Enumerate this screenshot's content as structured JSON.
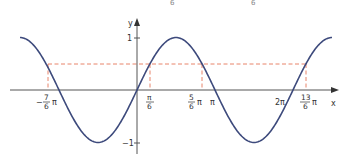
{
  "top_fragments": [
    "6",
    "6"
  ],
  "chart_data": {
    "type": "line",
    "title": "",
    "function": "y = sin(x)",
    "xlabel": "x",
    "ylabel": "y",
    "x_range_radians": [
      -4.712,
      7.854
    ],
    "ylim": [
      -1,
      1
    ],
    "grid": false,
    "legend": null,
    "series": [
      {
        "name": "sin(x)",
        "color": "#3d4a7c",
        "x": [
          -4.712,
          -3.665,
          -3.142,
          -2.618,
          -1.571,
          -0.524,
          0,
          0.524,
          1.571,
          2.618,
          3.142,
          3.665,
          4.712,
          5.76,
          6.283,
          6.807,
          7.854
        ],
        "values": [
          1,
          0.5,
          0,
          -0.5,
          -1,
          -0.5,
          0,
          0.5,
          1,
          0.5,
          0,
          -0.5,
          -1,
          -0.5,
          0,
          0.5,
          1
        ]
      }
    ],
    "reference_line": {
      "y": 0.5,
      "style": "dashed",
      "color": "#e8846b"
    },
    "marked_points": [
      {
        "label_num": "7",
        "label_den": "6",
        "sign": "−",
        "suffix": "π",
        "x": -3.665
      },
      {
        "label_num": "π",
        "label_den": "6",
        "sign": "",
        "suffix": "",
        "x": 0.524
      },
      {
        "label_num": "5",
        "label_den": "6",
        "sign": "",
        "suffix": "π",
        "x": 2.618
      },
      {
        "label_num": "13",
        "label_den": "6",
        "sign": "",
        "suffix": "π",
        "x": 6.807
      }
    ],
    "x_tick_labels": [
      "−7/6 π",
      "π/6",
      "5/6 π",
      "π",
      "2π",
      "13/6 π"
    ],
    "y_tick_labels": [
      "1",
      "−1"
    ],
    "axis_labels": {
      "x": "x",
      "y": "y"
    },
    "y_ticks": {
      "one": "1",
      "minus_one": "−1"
    },
    "x_ticks": {
      "pi": "π",
      "two_pi": "2π"
    }
  }
}
